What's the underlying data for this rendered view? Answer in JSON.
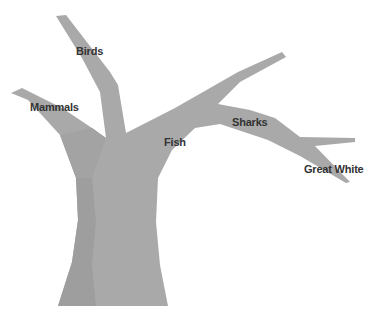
{
  "diagram": {
    "type": "tree",
    "colors": {
      "trunk_light": "#a9a9a9",
      "trunk_dark": "#9d9d9d",
      "label": "#333333",
      "background": "#ffffff"
    },
    "labels": [
      {
        "id": "birds",
        "text": "Birds",
        "x": 76,
        "y": 45
      },
      {
        "id": "mammals",
        "text": "Mammals",
        "x": 30,
        "y": 101
      },
      {
        "id": "fish",
        "text": "Fish",
        "x": 164,
        "y": 136
      },
      {
        "id": "sharks",
        "text": "Sharks",
        "x": 232,
        "y": 116
      },
      {
        "id": "great_white",
        "text": "Great White",
        "x": 304,
        "y": 163
      }
    ]
  }
}
